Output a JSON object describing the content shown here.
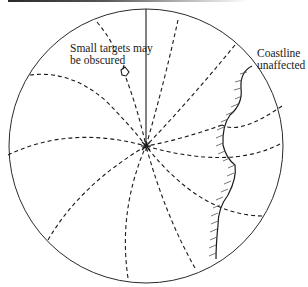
{
  "diagram": {
    "type": "radar-display-illustration",
    "labels": {
      "small_targets": "Small targets may\nbe obscured",
      "coastline": "Coastline\nunaffected"
    },
    "elements": {
      "display": "circular-radar-screen",
      "heading_line": "solid-line",
      "interference_pattern": "dashed-spiral-lines",
      "small_target": "target-blip",
      "coastline": "hatched-coastline"
    },
    "colors": {
      "ink": "#1a1a1a",
      "background": "#ffffff"
    }
  }
}
